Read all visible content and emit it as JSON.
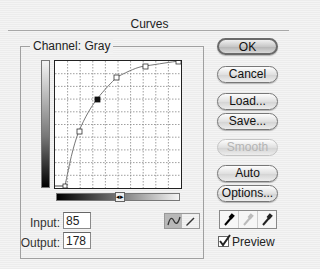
{
  "dialog": {
    "title": "Curves",
    "channel_label": "Channel:",
    "channel_value": "Gray",
    "input_label": "Input:",
    "input_value": "85",
    "output_label": "Output:",
    "output_value": "178",
    "mode_buttons": [
      {
        "icon": "curve-icon",
        "active": true
      },
      {
        "icon": "pencil-icon",
        "active": false
      }
    ],
    "buttons": [
      {
        "label": "OK",
        "default": true,
        "enabled": true
      },
      {
        "label": "Cancel",
        "default": false,
        "enabled": true
      },
      {
        "label": "Load...",
        "default": false,
        "enabled": true
      },
      {
        "label": "Save...",
        "default": false,
        "enabled": true
      },
      {
        "label": "Smooth",
        "default": false,
        "enabled": false
      },
      {
        "label": "Auto",
        "default": false,
        "enabled": true
      },
      {
        "label": "Options...",
        "default": false,
        "enabled": true
      }
    ],
    "eyedroppers": [
      {
        "icon": "black-eyedropper-icon",
        "enabled": true
      },
      {
        "icon": "gray-eyedropper-icon",
        "enabled": false
      },
      {
        "icon": "white-eyedropper-icon",
        "enabled": true
      }
    ],
    "preview_label": "Preview",
    "preview_checked": true,
    "curve": {
      "grid_divisions": 10,
      "points": [
        [
          10,
          5
        ],
        [
          38,
          113
        ],
        [
          85,
          178
        ],
        [
          138,
          220
        ],
        [
          195,
          242
        ],
        [
          255,
          255
        ]
      ],
      "active_point": [
        85,
        178
      ]
    }
  }
}
